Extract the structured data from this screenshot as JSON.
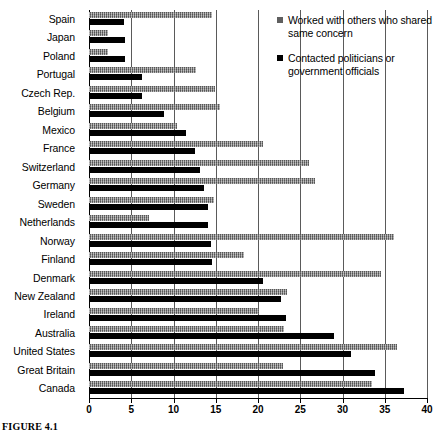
{
  "caption": "FIGURE 4.1",
  "legend": {
    "position": "top-right",
    "entries": [
      {
        "label": "Worked with others who shared same concern",
        "color": "#5f5f5f",
        "marker": "square-marker"
      },
      {
        "label": "Contacted politicians or government officials",
        "color": "#000000",
        "marker": "square-marker"
      }
    ]
  },
  "axis": {
    "x_ticks": [
      "0",
      "5",
      "10",
      "15",
      "20",
      "25",
      "30",
      "35",
      "40"
    ]
  },
  "chart_data": {
    "type": "bar",
    "orientation": "horizontal",
    "title": "",
    "subtitle": "",
    "xlabel": "",
    "ylabel": "",
    "xlim": [
      0,
      40
    ],
    "xticks": [
      0,
      5,
      10,
      15,
      20,
      25,
      30,
      35,
      40
    ],
    "grid": "vertical",
    "legend_position": "top-right",
    "categories": [
      "Spain",
      "Japan",
      "Poland",
      "Portugal",
      "Czech Rep.",
      "Belgium",
      "Mexico",
      "France",
      "Switzerland",
      "Germany",
      "Sweden",
      "Netherlands",
      "Norway",
      "Finland",
      "Denmark",
      "New Zealand",
      "Ireland",
      "Australia",
      "United States",
      "Great Britain",
      "Canada"
    ],
    "series": [
      {
        "name": "Worked with others who shared same concern",
        "color": "#8c8c8c",
        "values": [
          14.6,
          2.3,
          2.3,
          12.7,
          14.9,
          15.5,
          10.4,
          20.6,
          26.0,
          26.7,
          14.8,
          7.1,
          36.1,
          18.3,
          34.5,
          23.4,
          20.1,
          23.1,
          36.5,
          22.9,
          33.5
        ]
      },
      {
        "name": "Contacted politicians or government officials",
        "color": "#000000",
        "values": [
          4.2,
          4.3,
          4.3,
          6.3,
          6.3,
          8.9,
          11.5,
          12.5,
          13.1,
          13.6,
          14.1,
          14.1,
          14.4,
          14.6,
          20.6,
          22.7,
          23.3,
          29.0,
          31.0,
          33.8,
          37.3
        ]
      }
    ]
  }
}
